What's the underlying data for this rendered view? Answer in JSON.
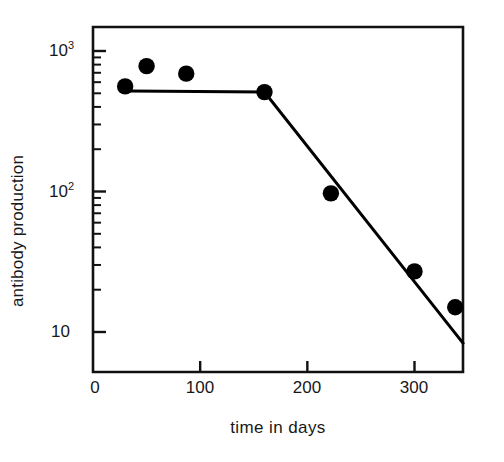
{
  "chart_data": {
    "type": "scatter",
    "title": "",
    "xlabel": "time in days",
    "ylabel": "antibody production",
    "xlim": [
      0,
      346
    ],
    "ylim": [
      7,
      1500
    ],
    "yscale": "log",
    "xscale": "linear",
    "grid": false,
    "legend": null,
    "xticks": [
      0,
      100,
      200,
      300
    ],
    "xtick_labels": [
      "0",
      "100",
      "200",
      "300"
    ],
    "yticks": [
      10,
      100,
      1000
    ],
    "ytick_labels": [
      "10",
      "10²",
      "10³"
    ],
    "ytick_label_bases": [
      "10",
      "10",
      "10"
    ],
    "ytick_label_exponents": [
      "",
      "2",
      "3"
    ],
    "yminor_ticks": [
      20,
      30,
      40,
      50,
      60,
      70,
      80,
      90,
      200,
      300,
      400,
      500,
      600,
      700,
      800,
      900,
      2000,
      3000,
      4000,
      5000,
      6000,
      7000,
      8000,
      9000
    ],
    "series": [
      {
        "name": "antibody production",
        "marker": "filled-circle",
        "marker_color": "#000000",
        "x": [
          30,
          50,
          87,
          160,
          222,
          300,
          338
        ],
        "y": [
          560,
          780,
          690,
          510,
          97,
          27,
          15
        ]
      }
    ],
    "fit_line": {
      "name": "piecewise fit",
      "color": "#000000",
      "x": [
        33,
        160,
        346
      ],
      "y": [
        520,
        510,
        8.2
      ]
    }
  }
}
